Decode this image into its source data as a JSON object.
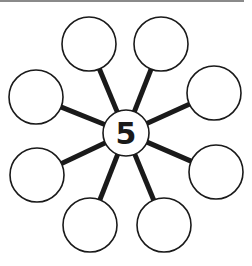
{
  "diagram": {
    "type": "number-bond-web",
    "center": {
      "label": "5",
      "cx": 126,
      "cy": 133,
      "r": 23
    },
    "outer_circles": [
      {
        "id": "top-left",
        "cx": 89,
        "cy": 44,
        "r": 27,
        "label": ""
      },
      {
        "id": "top-right",
        "cx": 161,
        "cy": 44,
        "r": 27,
        "label": ""
      },
      {
        "id": "upper-left",
        "cx": 36,
        "cy": 97,
        "r": 27,
        "label": ""
      },
      {
        "id": "upper-right",
        "cx": 214,
        "cy": 93,
        "r": 27,
        "label": ""
      },
      {
        "id": "lower-left",
        "cx": 37,
        "cy": 175,
        "r": 27,
        "label": ""
      },
      {
        "id": "lower-right",
        "cx": 216,
        "cy": 172,
        "r": 27,
        "label": ""
      },
      {
        "id": "bottom-left",
        "cx": 90,
        "cy": 225,
        "r": 27,
        "label": ""
      },
      {
        "id": "bottom-right",
        "cx": 164,
        "cy": 225,
        "r": 27,
        "label": ""
      }
    ],
    "colors": {
      "stroke": "#1a1a1a",
      "fill": "#ffffff",
      "background": "#ffffff"
    }
  }
}
